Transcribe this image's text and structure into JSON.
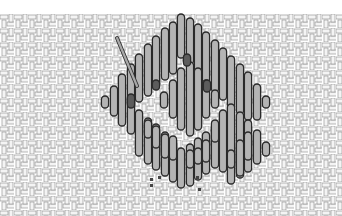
{
  "diagram": {
    "kind": "needlepoint-stitch-diagram",
    "colors": {
      "background": "#ffffff",
      "canvas_thread": "#d8d8d8",
      "canvas_outline": "#8a8a8a",
      "stitch_fill": "#b4b4b4",
      "stitch_outline": "#2a2a2a",
      "accent_stitch_fill": "#5c5c5c",
      "needle": "#9a9a9a",
      "marker_dot": "#444444"
    },
    "elements": {
      "canvas": "woven-mesh",
      "needle": "needle-icon",
      "stitches": "vertical-straight-stitches",
      "accent_stitches": "dark-filler-stitches",
      "markers": "placement-dots"
    }
  }
}
